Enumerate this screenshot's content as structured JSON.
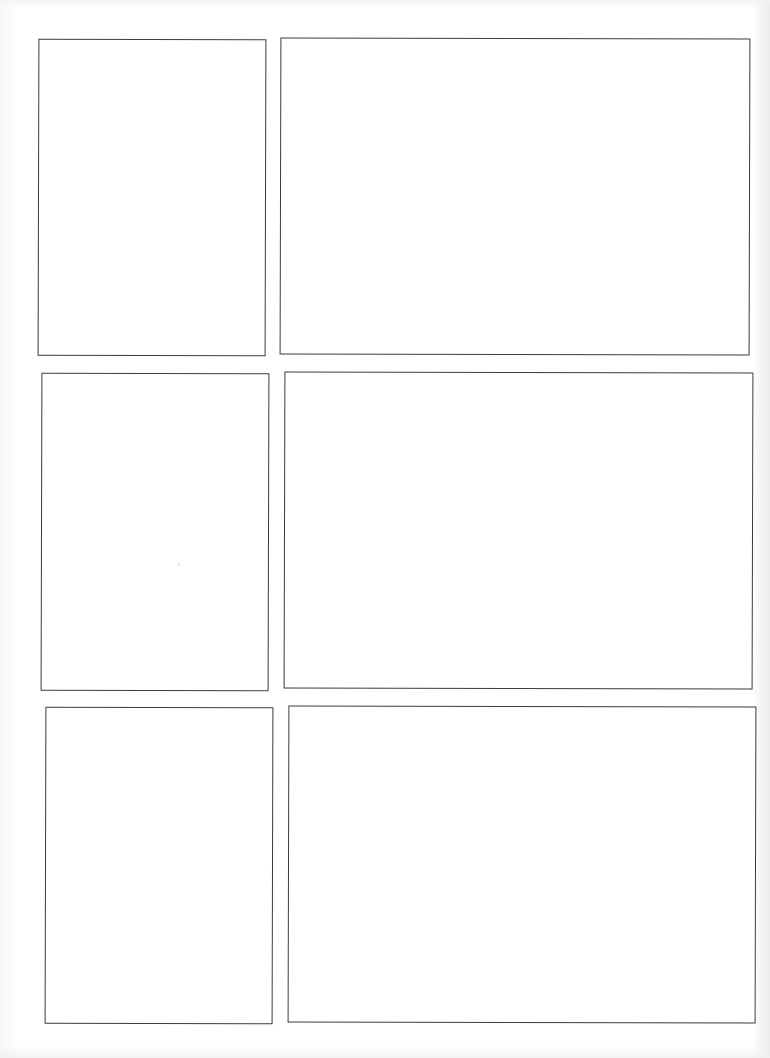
{
  "page": {
    "type": "blank comic / storyboard panel template",
    "layout": {
      "rows": 3,
      "columns": 2
    },
    "background_color": "#ffffff",
    "border_color": "#3c3c3c"
  },
  "panels": [
    {
      "id": 1,
      "row": 1,
      "col": 1,
      "content": ""
    },
    {
      "id": 2,
      "row": 1,
      "col": 2,
      "content": ""
    },
    {
      "id": 3,
      "row": 2,
      "col": 1,
      "content": ""
    },
    {
      "id": 4,
      "row": 2,
      "col": 2,
      "content": ""
    },
    {
      "id": 5,
      "row": 3,
      "col": 1,
      "content": ""
    },
    {
      "id": 6,
      "row": 3,
      "col": 2,
      "content": ""
    }
  ]
}
